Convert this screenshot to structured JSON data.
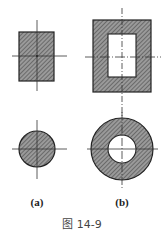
{
  "figure": {
    "caption": "图 14-9",
    "labels": {
      "a": "(a)",
      "b": "(b)"
    },
    "colors": {
      "hatch_fill": "#8a8a8a",
      "hatch_line": "#3a3a3a",
      "outline": "#222222",
      "axis": "#333333",
      "background": "#ffffff"
    },
    "shapes": [
      {
        "name": "solid-rectangle",
        "column": "a",
        "x": 19,
        "y": 32,
        "w": 35,
        "h": 49,
        "center": [
          37,
          56
        ]
      },
      {
        "name": "hollow-rectangle",
        "column": "b",
        "outer": {
          "x": 93,
          "y": 20,
          "w": 58,
          "h": 72
        },
        "inner": {
          "x": 108,
          "y": 34,
          "w": 28,
          "h": 43
        },
        "center": [
          122,
          57
        ]
      },
      {
        "name": "solid-circle",
        "column": "a",
        "cx": 37,
        "cy": 149,
        "r": 18
      },
      {
        "name": "hollow-circle",
        "column": "b",
        "cx": 122,
        "cy": 149,
        "r_outer": 31,
        "r_inner": 14
      }
    ]
  }
}
